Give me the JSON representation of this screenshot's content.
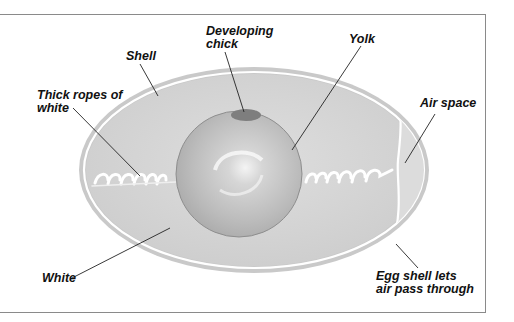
{
  "diagram": {
    "labels": {
      "shell": "Shell",
      "developing_chick": "Developing\nchick",
      "yolk": "Yolk",
      "thick_ropes": "Thick ropes of\nwhite",
      "air_space": "Air space",
      "white": "White",
      "egg_shell_air": "Egg shell lets\nair pass through"
    },
    "colors": {
      "shell_rim": "#c8c8c8",
      "white": "#d4d4d4",
      "yolk": "#bdbdbd",
      "chick": "#7e7e7e",
      "leader_line": "#222222",
      "frame": "#8a8a8a"
    }
  }
}
